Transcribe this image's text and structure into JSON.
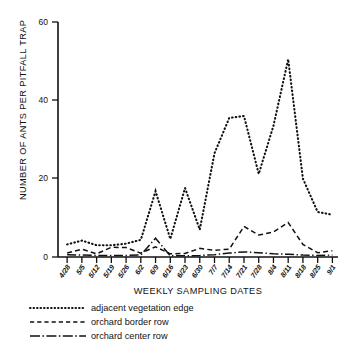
{
  "chart_data": {
    "type": "line",
    "title": "",
    "xlabel": "WEEKLY SAMPLING DATES",
    "ylabel": "NUMBER OF ANTS PER PITFALL TRAP",
    "ylim": [
      0,
      60
    ],
    "yticks": [
      0,
      20,
      40,
      60
    ],
    "grid": false,
    "legend_position": "below-left",
    "categories": [
      "4/28",
      "5/5",
      "5/12",
      "5/19",
      "5/26",
      "6/2",
      "6/9",
      "6/16",
      "6/23",
      "6/30",
      "7/7",
      "7/14",
      "7/21",
      "7/28",
      "8/4",
      "8/11",
      "8/18",
      "8/25",
      "9/1"
    ],
    "series": [
      {
        "name": "adjacent vegetation edge",
        "style": "dotted",
        "values": [
          3.2,
          4.2,
          3.0,
          3.0,
          3.4,
          4.4,
          16.8,
          4.6,
          17.6,
          7.0,
          26.5,
          35.5,
          36.0,
          21.2,
          33.5,
          50.5,
          20.0,
          11.5,
          10.8
        ]
      },
      {
        "name": "orchard border row",
        "style": "dashed",
        "values": [
          1.0,
          2.0,
          0.8,
          2.5,
          2.4,
          1.0,
          2.6,
          0.8,
          0.9,
          2.2,
          1.7,
          2.0,
          7.8,
          5.6,
          6.4,
          8.8,
          3.2,
          1.1,
          1.6
        ]
      },
      {
        "name": "orchard center row",
        "style": "dash-dot",
        "values": [
          0.6,
          0.5,
          0.4,
          0.4,
          0.4,
          0.5,
          4.8,
          0.3,
          0.3,
          0.4,
          0.6,
          1.0,
          1.3,
          1.1,
          0.8,
          0.7,
          0.5,
          0.4,
          0.5
        ]
      }
    ]
  },
  "axes": {
    "y_tick_labels": [
      "60",
      "40",
      "20",
      "0"
    ],
    "y_axis_title": "NUMBER OF ANTS PER PITFALL TRAP",
    "x_axis_title": "WEEKLY SAMPLING DATES",
    "x_tick_labels": [
      "4/28",
      "5/5",
      "5/12",
      "5/19",
      "5/26",
      "6/2",
      "6/9",
      "6/16",
      "6/23",
      "6/30",
      "7/7",
      "7/14",
      "7/21",
      "7/28",
      "8/4",
      "8/11",
      "8/18",
      "8/25",
      "9/1"
    ]
  },
  "legend": {
    "items": [
      {
        "label": "adjacent vegetation edge",
        "style": "dotted"
      },
      {
        "label": "orchard border row",
        "style": "dashed"
      },
      {
        "label": "orchard center row",
        "style": "dash-dot"
      }
    ]
  },
  "colors": {
    "ink": "#111111",
    "background": "#ffffff"
  }
}
